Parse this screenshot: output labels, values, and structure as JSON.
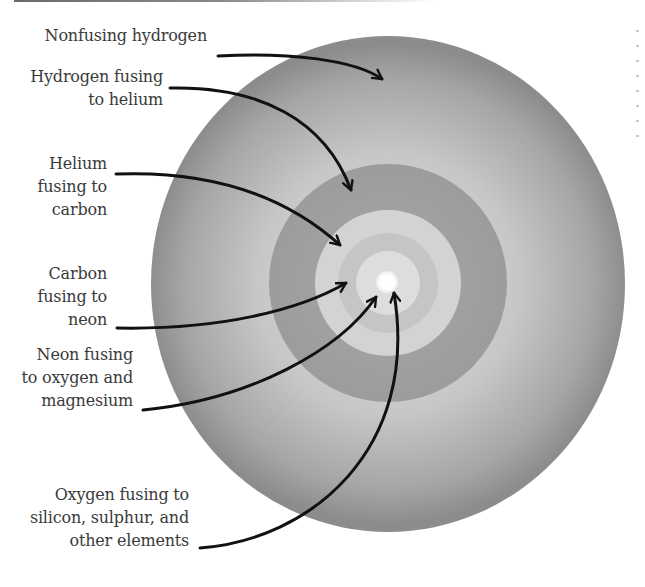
{
  "diagram": {
    "layers": [
      {
        "id": "nonfusing-hydrogen",
        "lines": [
          "Nonfusing hydrogen"
        ],
        "fill": "#9a9a9a"
      },
      {
        "id": "hydrogen-to-helium",
        "lines": [
          "Hydrogen fusing",
          "to helium"
        ],
        "fill": "#a2a2a2"
      },
      {
        "id": "helium-to-carbon",
        "lines": [
          "Helium",
          "fusing to",
          "carbon"
        ],
        "fill": "#d2d2d2"
      },
      {
        "id": "carbon-to-neon",
        "lines": [
          "Carbon",
          "fusing to",
          "neon"
        ],
        "fill": "#c4c4c4"
      },
      {
        "id": "neon-to-oxygen-magnesium",
        "lines": [
          "Neon fusing",
          "to oxygen and",
          "magnesium"
        ],
        "fill": "#dcdcdc"
      },
      {
        "id": "oxygen-to-silicon-sulphur",
        "lines": [
          "Oxygen fusing to",
          "silicon, sulphur, and",
          "other elements"
        ],
        "fill": "#ffffff"
      }
    ]
  }
}
